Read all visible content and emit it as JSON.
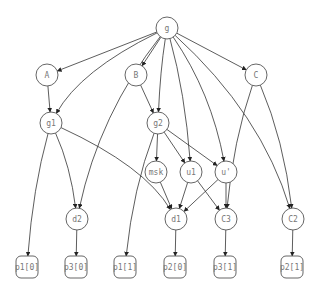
{
  "diagram": {
    "type": "directed-graph",
    "nodes": [
      {
        "id": "g",
        "label": "g",
        "shape": "circle",
        "x": 167,
        "y": 28,
        "r": 11
      },
      {
        "id": "A",
        "label": "A",
        "shape": "circle",
        "x": 47,
        "y": 75,
        "r": 11
      },
      {
        "id": "B",
        "label": "B",
        "shape": "circle",
        "x": 136,
        "y": 75,
        "r": 11
      },
      {
        "id": "C",
        "label": "C",
        "shape": "circle",
        "x": 256,
        "y": 75,
        "r": 11
      },
      {
        "id": "g1",
        "label": "g1",
        "shape": "circle",
        "x": 51,
        "y": 123,
        "r": 11
      },
      {
        "id": "g2",
        "label": "g2",
        "shape": "circle",
        "x": 158,
        "y": 123,
        "r": 11
      },
      {
        "id": "msk",
        "label": "msk",
        "shape": "circle",
        "x": 156,
        "y": 172,
        "r": 11
      },
      {
        "id": "u1",
        "label": "u1",
        "shape": "circle",
        "x": 191,
        "y": 172,
        "r": 11
      },
      {
        "id": "u'",
        "label": "u'",
        "shape": "circle",
        "x": 226,
        "y": 172,
        "r": 11
      },
      {
        "id": "d2",
        "label": "d2",
        "shape": "circle",
        "x": 77,
        "y": 219,
        "r": 11
      },
      {
        "id": "d1",
        "label": "d1",
        "shape": "circle",
        "x": 176,
        "y": 219,
        "r": 11
      },
      {
        "id": "C3",
        "label": "C3",
        "shape": "circle",
        "x": 226,
        "y": 219,
        "r": 11
      },
      {
        "id": "C2",
        "label": "C2",
        "shape": "circle",
        "x": 293,
        "y": 219,
        "r": 11
      },
      {
        "id": "p1_0",
        "label": "p1[0]",
        "shape": "rounded-box",
        "x": 27,
        "y": 267
      },
      {
        "id": "p3_0",
        "label": "p3[0]",
        "shape": "rounded-box",
        "x": 76,
        "y": 267
      },
      {
        "id": "p1_1",
        "label": "p1[1]",
        "shape": "rounded-box",
        "x": 125,
        "y": 267
      },
      {
        "id": "p2_0",
        "label": "p2[0]",
        "shape": "rounded-box",
        "x": 175,
        "y": 267
      },
      {
        "id": "p3_1",
        "label": "p3[1]",
        "shape": "rounded-box",
        "x": 225,
        "y": 267
      },
      {
        "id": "p2_1",
        "label": "p2[1]",
        "shape": "rounded-box",
        "x": 292,
        "y": 267
      }
    ],
    "edges": [
      {
        "from": "g",
        "to": "A"
      },
      {
        "from": "g",
        "to": "g1"
      },
      {
        "from": "g",
        "to": "d2"
      },
      {
        "from": "g",
        "to": "B"
      },
      {
        "from": "g",
        "to": "g2"
      },
      {
        "from": "g",
        "to": "u1"
      },
      {
        "from": "g",
        "to": "u'"
      },
      {
        "from": "g",
        "to": "C"
      },
      {
        "from": "g",
        "to": "C2"
      },
      {
        "from": "A",
        "to": "g1"
      },
      {
        "from": "B",
        "to": "g2"
      },
      {
        "from": "C",
        "to": "C3"
      },
      {
        "from": "C",
        "to": "C2"
      },
      {
        "from": "g1",
        "to": "p1_0"
      },
      {
        "from": "g1",
        "to": "d2"
      },
      {
        "from": "g1",
        "to": "d1"
      },
      {
        "from": "g2",
        "to": "p1_1"
      },
      {
        "from": "g2",
        "to": "msk"
      },
      {
        "from": "g2",
        "to": "u1"
      },
      {
        "from": "g2",
        "to": "u'"
      },
      {
        "from": "msk",
        "to": "d1"
      },
      {
        "from": "u1",
        "to": "d1"
      },
      {
        "from": "u1",
        "to": "C3"
      },
      {
        "from": "u'",
        "to": "d1"
      },
      {
        "from": "u'",
        "to": "C3"
      },
      {
        "from": "d2",
        "to": "p3_0"
      },
      {
        "from": "d1",
        "to": "p2_0"
      },
      {
        "from": "C3",
        "to": "p3_1"
      },
      {
        "from": "C2",
        "to": "p2_1"
      }
    ]
  }
}
